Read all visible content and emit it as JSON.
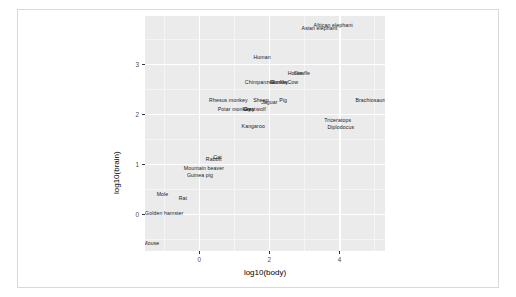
{
  "chart_data": {
    "type": "scatter",
    "title": "",
    "subtitle": "",
    "xlabel": "log10(body)",
    "ylabel": "log10(brain)",
    "xlim": [
      -1.55,
      5.3
    ],
    "ylim": [
      -0.75,
      3.95
    ],
    "xticks": [
      0,
      2,
      4
    ],
    "yticks": [
      0,
      1,
      2,
      3
    ],
    "xtick_labels": [
      "0",
      "2",
      "4"
    ],
    "ytick_labels": [
      "0",
      "1",
      "2",
      "3"
    ],
    "x_minor_ticks": [
      -1,
      1,
      3,
      5
    ],
    "y_minor_ticks": [
      -0.5,
      0.5,
      1.5,
      2.5,
      3.5
    ],
    "grid": true,
    "legend": "none",
    "marker": "text-label",
    "panel_background": "#ebebeb",
    "gridline_color": "#ffffff",
    "label_color": "#1a1a1a",
    "points": [
      {
        "label": "African elephant",
        "x": 3.82,
        "y": 3.76
      },
      {
        "label": "Asian elephant",
        "x": 3.43,
        "y": 3.7
      },
      {
        "label": "Human",
        "x": 1.79,
        "y": 3.12
      },
      {
        "label": "Giraffe",
        "x": 2.93,
        "y": 2.79
      },
      {
        "label": "Horse",
        "x": 2.73,
        "y": 2.79
      },
      {
        "label": "Chimpanzee",
        "x": 1.73,
        "y": 2.62
      },
      {
        "label": "Gorilla",
        "x": 2.28,
        "y": 2.62
      },
      {
        "label": "Donkey",
        "x": 2.28,
        "y": 2.62
      },
      {
        "label": "Cow",
        "x": 2.67,
        "y": 2.62
      },
      {
        "label": "Rhesus monkey",
        "x": 0.83,
        "y": 2.26
      },
      {
        "label": "Sheep",
        "x": 1.76,
        "y": 2.26
      },
      {
        "label": "Jaguar",
        "x": 2.0,
        "y": 2.21
      },
      {
        "label": "Pig",
        "x": 2.39,
        "y": 2.26
      },
      {
        "label": "Potar monkey",
        "x": 1.0,
        "y": 2.08
      },
      {
        "label": "Goat",
        "x": 1.44,
        "y": 2.08
      },
      {
        "label": "Grey wolf",
        "x": 1.57,
        "y": 2.08
      },
      {
        "label": "Brachiosaurus",
        "x": 4.95,
        "y": 2.26
      },
      {
        "label": "Triceratops",
        "x": 3.95,
        "y": 1.85
      },
      {
        "label": "Diplodocus",
        "x": 4.04,
        "y": 1.72
      },
      {
        "label": "Kangaroo",
        "x": 1.54,
        "y": 1.74
      },
      {
        "label": "Cat",
        "x": 0.52,
        "y": 1.11
      },
      {
        "label": "Rabbit",
        "x": 0.41,
        "y": 1.07
      },
      {
        "label": "Mountain beaver",
        "x": 0.13,
        "y": 0.9
      },
      {
        "label": "Guinea pig",
        "x": 0.02,
        "y": 0.76
      },
      {
        "label": "Mole",
        "x": -1.05,
        "y": 0.38
      },
      {
        "label": "Rat",
        "x": -0.47,
        "y": 0.3
      },
      {
        "label": "Golden hamster",
        "x": -1.0,
        "y": 0.0
      },
      {
        "label": "Mouse",
        "x": -1.37,
        "y": -0.6
      }
    ]
  }
}
